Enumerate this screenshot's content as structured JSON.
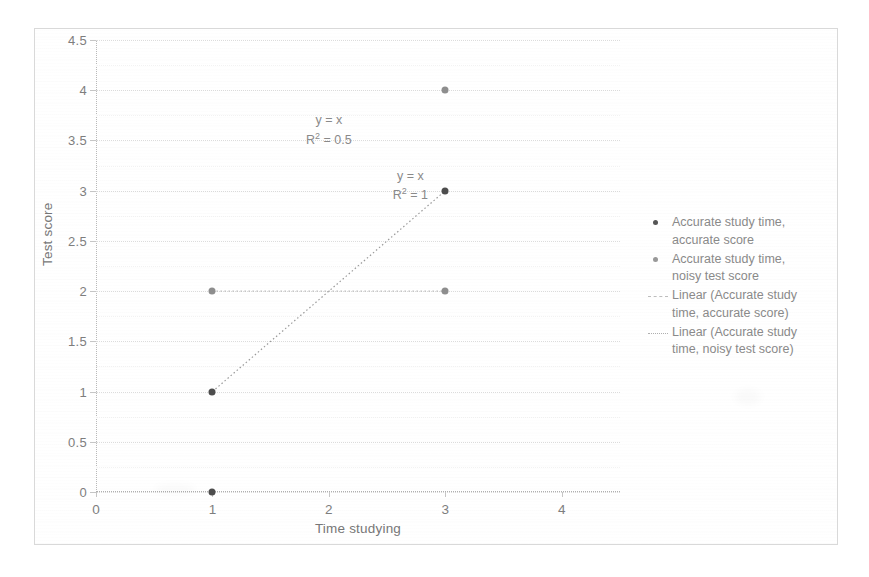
{
  "chart_data": {
    "type": "scatter",
    "title": "",
    "xlabel": "Time studying",
    "ylabel": "Test score",
    "xlim": [
      0,
      4.5
    ],
    "ylim": [
      0,
      4.5
    ],
    "xticks": [
      0,
      1,
      2,
      3,
      4
    ],
    "xtick_labels": [
      "0",
      "1",
      "2",
      "3",
      "4"
    ],
    "yticks": [
      0,
      0.5,
      1,
      1.5,
      2,
      2.5,
      3,
      3.5,
      4,
      4.5
    ],
    "ytick_labels": [
      "0",
      "0.5",
      "1",
      "1.5",
      "2",
      "2.5",
      "3",
      "3.5",
      "4",
      "4.5"
    ],
    "grid": true,
    "legend_position": "right",
    "series": [
      {
        "name": "Accurate study time, accurate score",
        "marker": "dot",
        "color": "#4d4d4d",
        "points": [
          {
            "x": 1,
            "y": 0
          },
          {
            "x": 1,
            "y": 1
          },
          {
            "x": 3,
            "y": 3
          }
        ]
      },
      {
        "name": "Accurate study time, noisy test score",
        "marker": "dot",
        "color": "#8e8e8e",
        "points": [
          {
            "x": 1,
            "y": 2
          },
          {
            "x": 3,
            "y": 2
          },
          {
            "x": 3,
            "y": 4
          }
        ]
      }
    ],
    "trendlines": [
      {
        "name": "Linear (Accurate study time, accurate score)",
        "style": "dotted",
        "color": "#9a9a9a",
        "from": {
          "x": 1,
          "y": 1
        },
        "to": {
          "x": 3,
          "y": 3
        },
        "equation": "y = x",
        "r_squared": "1"
      },
      {
        "name": "Linear (Accurate study time, noisy test score)",
        "style": "dotted",
        "color": "#bdbdbd",
        "from": {
          "x": 1,
          "y": 2
        },
        "to": {
          "x": 3,
          "y": 2
        },
        "equation": "y = x",
        "r_squared": "0.5"
      }
    ],
    "annotations": [
      {
        "id": "noisy-fit-label",
        "equation": "y = x",
        "r_label": "R",
        "r_sup": "2",
        "r_value": " = 0.5",
        "x": 2.0,
        "y": 3.6
      },
      {
        "id": "accurate-fit-label",
        "equation": "y = x",
        "r_label": "R",
        "r_sup": "2",
        "r_value": " = 1",
        "x": 2.7,
        "y": 3.05
      }
    ]
  },
  "axes": {
    "x_title": "Time studying",
    "y_title": "Test score"
  },
  "legend": {
    "entries": [
      {
        "key": "accurate-dot",
        "label": "Accurate study time,\naccurate score"
      },
      {
        "key": "noisy-dot",
        "label": "Accurate study time,\nnoisy test score"
      },
      {
        "key": "accurate-trend",
        "label": "Linear (Accurate study\ntime, accurate score)"
      },
      {
        "key": "noisy-trend",
        "label": "Linear (Accurate study\ntime, noisy test score)"
      }
    ]
  },
  "colors": {
    "accurate_marker": "#4d4d4d",
    "noisy_marker": "#8e8e8e",
    "grid": "#e7e7e7",
    "axis_text": "#7e7e7e",
    "frame": "#d9d9d9"
  }
}
